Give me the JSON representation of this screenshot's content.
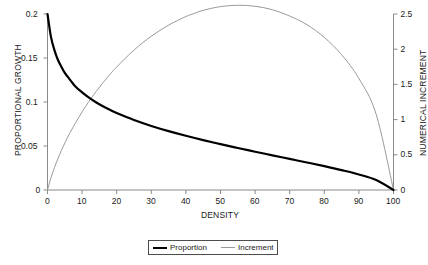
{
  "chart_data": {
    "type": "line",
    "title": "",
    "subtitle": "",
    "xlabel": "DENSITY",
    "ylabel": "PROPORTIONAL GROWTH",
    "y2label": "NUMERICAL INCREMENT",
    "xlim": [
      0,
      100
    ],
    "ylim": [
      0,
      0.2
    ],
    "y2lim": [
      0,
      2.5
    ],
    "xticks": [
      0,
      10,
      20,
      30,
      40,
      50,
      60,
      70,
      80,
      90,
      100
    ],
    "xticklabels": [
      "0",
      "10",
      "20",
      "30",
      "40",
      "50",
      "60",
      "70",
      "80",
      "90",
      "100"
    ],
    "yticks": [
      0,
      0.05,
      0.1,
      0.15,
      0.2
    ],
    "yticklabels": [
      "0",
      "0.05",
      "0.1",
      "0.15",
      "0.2"
    ],
    "y2ticks": [
      0,
      0.5,
      1,
      1.5,
      2,
      2.5
    ],
    "y2ticklabels": [
      "0",
      "0.5",
      "1",
      "1.5",
      "2",
      "2.5"
    ],
    "grid": false,
    "legend_position": "bottom-center",
    "series": [
      {
        "name": "Proportion",
        "axis": "left",
        "color": "#000000",
        "linewidth": 2.2,
        "x": [
          0,
          1,
          2,
          3,
          4,
          5,
          6,
          8,
          10,
          12,
          14,
          16,
          18,
          20,
          25,
          30,
          35,
          40,
          45,
          50,
          55,
          60,
          65,
          70,
          75,
          80,
          85,
          90,
          95,
          100
        ],
        "values": [
          0.2,
          0.174,
          0.159,
          0.148,
          0.14,
          0.133,
          0.128,
          0.118,
          0.111,
          0.105,
          0.0997,
          0.0952,
          0.0911,
          0.0874,
          0.0795,
          0.0728,
          0.0669,
          0.0616,
          0.0567,
          0.0521,
          0.0477,
          0.0435,
          0.0394,
          0.0353,
          0.0313,
          0.0271,
          0.0226,
          0.0176,
          0.0113,
          0.0
        ]
      },
      {
        "name": "Increment",
        "axis": "right",
        "color": "#9a9a9a",
        "linewidth": 1.0,
        "x": [
          0,
          1,
          2,
          3,
          4,
          5,
          6,
          8,
          10,
          12,
          14,
          16,
          18,
          20,
          25,
          30,
          35,
          40,
          42,
          45,
          50,
          55,
          60,
          65,
          70,
          75,
          80,
          85,
          90,
          95,
          100
        ],
        "values": [
          0.0,
          0.174,
          0.318,
          0.444,
          0.56,
          0.665,
          0.768,
          0.944,
          1.11,
          1.26,
          1.396,
          1.523,
          1.64,
          1.748,
          1.988,
          2.184,
          2.342,
          2.464,
          2.5,
          2.552,
          2.605,
          2.624,
          2.61,
          2.561,
          2.471,
          2.348,
          2.168,
          1.921,
          1.584,
          1.074,
          0.0
        ]
      }
    ],
    "annotations": []
  },
  "legend": {
    "items": [
      {
        "label": "Proportion",
        "style": "thick"
      },
      {
        "label": "Increment",
        "style": "thin"
      }
    ]
  }
}
